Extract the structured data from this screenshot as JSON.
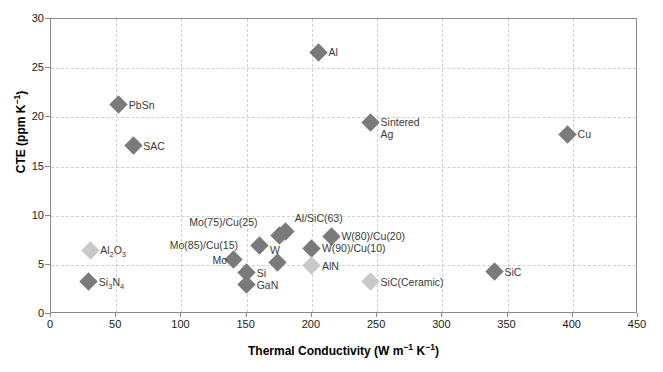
{
  "chart_data": {
    "type": "scatter",
    "title": "",
    "xlabel": "Thermal Conductivity (W m⁻¹ K⁻¹)",
    "ylabel": "CTE (ppm K⁻¹)",
    "xlim": [
      0,
      450
    ],
    "ylim": [
      0,
      30
    ],
    "xticks": [
      0,
      50,
      100,
      150,
      200,
      250,
      300,
      350,
      400,
      450
    ],
    "yticks": [
      0,
      5,
      10,
      15,
      20,
      25,
      30
    ],
    "grid": true,
    "legend": "none",
    "marker": "diamond",
    "colors": {
      "dark_gray": "#7a7a7a",
      "light_gray": "#c9c9c9",
      "frame": "#8a8a8a",
      "gridline": "#cfcfcf",
      "text": "#1a1a1a",
      "label_text": "#3a3a3a"
    },
    "points": [
      {
        "label": "Al",
        "x": 205,
        "y": 26.6,
        "shade": "dark",
        "lx": 10,
        "ly": -6
      },
      {
        "label": "PbSn",
        "x": 52,
        "y": 21.3,
        "shade": "dark",
        "lx": 10,
        "ly": -6
      },
      {
        "label": "SAC",
        "x": 63,
        "y": 17.1,
        "shade": "dark",
        "lx": 10,
        "ly": -6
      },
      {
        "label": "Sintered\nAg",
        "x": 245,
        "y": 19.5,
        "shade": "dark",
        "lx": 10,
        "ly": -6
      },
      {
        "label": "Cu",
        "x": 396,
        "y": 18.3,
        "shade": "dark",
        "lx": 10,
        "ly": -6
      },
      {
        "label": "Al₂O₃",
        "x": 30,
        "y": 6.5,
        "shade": "light",
        "lx": 10,
        "ly": -6
      },
      {
        "label": "Si₃N₄",
        "x": 29,
        "y": 3.3,
        "shade": "dark",
        "lx": 10,
        "ly": -6
      },
      {
        "label": "Mo(75)/Cu(25)",
        "x": 175,
        "y": 8.0,
        "shade": "dark",
        "lx": -90,
        "ly": -19
      },
      {
        "label": "Mo(85)/Cu(15)",
        "x": 160,
        "y": 7.0,
        "shade": "dark",
        "lx": -90,
        "ly": -6
      },
      {
        "label": "Mo",
        "x": 140,
        "y": 5.5,
        "shade": "dark",
        "lx": -21,
        "ly": -6
      },
      {
        "label": "Al/SiC(63)",
        "x": 180,
        "y": 8.4,
        "shade": "dark",
        "lx": 9,
        "ly": -19
      },
      {
        "label": "W(80)/Cu(20)",
        "x": 215,
        "y": 7.9,
        "shade": "dark",
        "lx": 10,
        "ly": -6
      },
      {
        "label": "W(90)/Cu(10)",
        "x": 200,
        "y": 6.7,
        "shade": "dark",
        "lx": 10,
        "ly": -6
      },
      {
        "label": "W",
        "x": 174,
        "y": 5.2,
        "shade": "dark",
        "lx": -8,
        "ly": -19
      },
      {
        "label": "Si",
        "x": 150,
        "y": 4.2,
        "shade": "dark",
        "lx": 10,
        "ly": -6
      },
      {
        "label": "GaN",
        "x": 150,
        "y": 3.0,
        "shade": "dark",
        "lx": 10,
        "ly": -6
      },
      {
        "label": "AlN",
        "x": 200,
        "y": 4.9,
        "shade": "light",
        "lx": 10,
        "ly": -6
      },
      {
        "label": "SiC(Ceramic)",
        "x": 245,
        "y": 3.3,
        "shade": "light",
        "lx": 10,
        "ly": -6
      },
      {
        "label": "SiC",
        "x": 340,
        "y": 4.3,
        "shade": "dark",
        "lx": 10,
        "ly": -6
      }
    ]
  }
}
